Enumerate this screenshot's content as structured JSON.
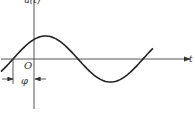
{
  "diagram": {
    "type": "sinusoid-phase-diagram",
    "y_axis_label": "u(t)",
    "x_axis_label": "t",
    "origin_label": "O",
    "phase_label": "φ",
    "curve": {
      "function": "sine",
      "phase_shift": "φ (leading, curve crosses zero before origin)",
      "cycles_shown": 1.3
    },
    "colors": {
      "stroke": "#333333",
      "background": "#ffffff"
    }
  }
}
